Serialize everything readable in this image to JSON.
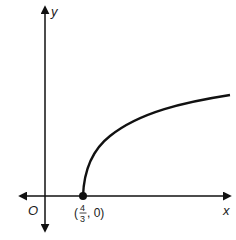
{
  "figure": {
    "type": "function-graph",
    "curve": "square-root curve starting at (4/3, 0), increasing and concave down to the right",
    "axes": {
      "x_label": "x",
      "y_label": "y",
      "origin_label": "O"
    },
    "point": {
      "label_open": "(",
      "numerator": "4",
      "denominator": "3",
      "label_close": ", 0)",
      "x": "4/3",
      "y": "0"
    },
    "colors": {
      "stroke": "#111111",
      "background": "#ffffff"
    }
  }
}
